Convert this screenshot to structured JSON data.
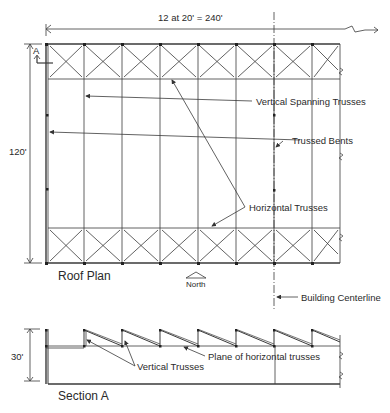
{
  "diagram": {
    "type": "structural roof plan and section",
    "roof_plan": {
      "title": "Roof Plan",
      "width_dimension": "12 at 20'  =  240'",
      "depth_dimension": "120'",
      "section_marker": "A",
      "north_label": "North",
      "bays_shown": 8,
      "callouts": {
        "vertical_spanning_trusses": "Vertical Spanning Trusses",
        "trussed_bents": "Trussed Bents",
        "horizontal_trusses": "Horizontal Trusses",
        "building_centerline": "Building Centerline"
      }
    },
    "section": {
      "title": "Section A",
      "height_dimension": "30'",
      "callouts": {
        "vertical_trusses": "Vertical Trusses",
        "plane_of_horizontal_trusses": "Plane of horizontal trusses"
      }
    },
    "colors": {
      "line": "#3a3a3a",
      "background": "#ffffff"
    }
  }
}
